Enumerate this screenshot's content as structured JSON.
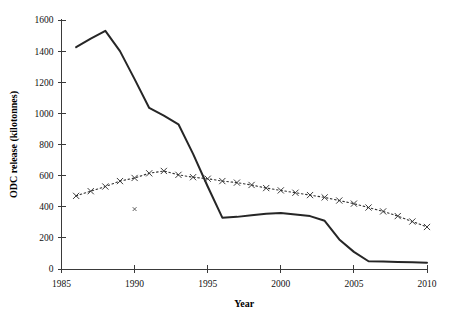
{
  "chart_data": {
    "type": "line",
    "title": "",
    "subtitle": "",
    "xlabel": "Year",
    "ylabel": "ODC release (kilotonnes)",
    "xlim": [
      1985,
      2010
    ],
    "ylim": [
      0,
      1600
    ],
    "xticks": [
      1985,
      1990,
      1995,
      2000,
      2005,
      2010
    ],
    "yticks": [
      0,
      200,
      400,
      600,
      800,
      1000,
      1200,
      1400,
      1600
    ],
    "xtick_labels": [
      "1985",
      "1990",
      "1995",
      "2000",
      "2005",
      "2010"
    ],
    "ytick_labels": [
      "0",
      "200",
      "400",
      "600",
      "800",
      "1000",
      "1200",
      "1400",
      "1600"
    ],
    "grid": false,
    "legend": null,
    "legend_position": "none",
    "series": [
      {
        "name": "ODC release (solid line)",
        "style": "solid-line",
        "marker": "none",
        "color": "#262626",
        "x": [
          1986,
          1987,
          1988,
          1989,
          1990,
          1991,
          1992,
          1993,
          1994,
          1995,
          1996,
          1997,
          1998,
          1999,
          2000,
          2001,
          2002,
          2003,
          2004,
          2005,
          2006,
          2007,
          2008,
          2009,
          2010
        ],
        "values": [
          1425,
          1480,
          1530,
          1400,
          1220,
          1035,
          985,
          930,
          740,
          530,
          330,
          335,
          345,
          355,
          360,
          350,
          340,
          310,
          190,
          110,
          50,
          48,
          45,
          43,
          40
        ]
      },
      {
        "name": "ODC release (dotted line with x markers)",
        "style": "dotted-line",
        "marker": "x",
        "color": "#333333",
        "x": [
          1986,
          1987,
          1988,
          1989,
          1990,
          1991,
          1992,
          1993,
          1994,
          1995,
          1996,
          1997,
          1998,
          1999,
          2000,
          2001,
          2002,
          2003,
          2004,
          2005,
          2006,
          2007,
          2008,
          2009,
          2010
        ],
        "values": [
          470,
          500,
          530,
          565,
          585,
          615,
          630,
          605,
          590,
          580,
          565,
          555,
          540,
          520,
          505,
          490,
          475,
          460,
          440,
          420,
          395,
          370,
          340,
          305,
          270
        ]
      },
      {
        "name": "isolated point",
        "style": "point",
        "marker": "dot",
        "color": "#555555",
        "x": [
          1990
        ],
        "values": [
          385
        ]
      }
    ]
  },
  "axes": {
    "y_title": "ODC release (kilotonnes)",
    "x_title": "Year"
  }
}
